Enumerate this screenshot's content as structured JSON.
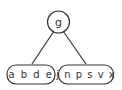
{
  "diagram": {
    "type": "b-tree",
    "root": {
      "label": "g"
    },
    "children": [
      {
        "label": "a b d e",
        "keys": [
          "a",
          "b",
          "d",
          "e"
        ]
      },
      {
        "label": "j n p s v x",
        "keys": [
          "j",
          "n",
          "p",
          "s",
          "v",
          "x"
        ]
      }
    ],
    "colors": {
      "stroke": "#333333",
      "text": "#333333",
      "background": "#ffffff"
    }
  }
}
